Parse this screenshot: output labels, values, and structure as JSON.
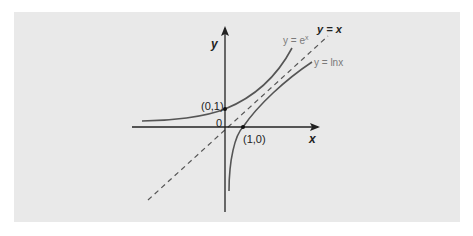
{
  "diagram": {
    "axes": {
      "x_label": "x",
      "y_label": "y",
      "origin_label": "0"
    },
    "curves": [
      {
        "name": "exponential",
        "label": "y = e",
        "superscript": "x"
      },
      {
        "name": "logarithm",
        "label": "y = lnx"
      },
      {
        "name": "identity-line",
        "label": "y = x",
        "style": "dashed"
      }
    ],
    "points": [
      {
        "label": "(0,1)",
        "x": 0,
        "y": 1
      },
      {
        "label": "(1,0)",
        "x": 1,
        "y": 0
      }
    ],
    "colors": {
      "panel_background": "#e9e9e9",
      "axis": "#222222",
      "curve": "#555555",
      "curve_label": "#7a7a7a",
      "dashed_line": "#555555"
    }
  }
}
